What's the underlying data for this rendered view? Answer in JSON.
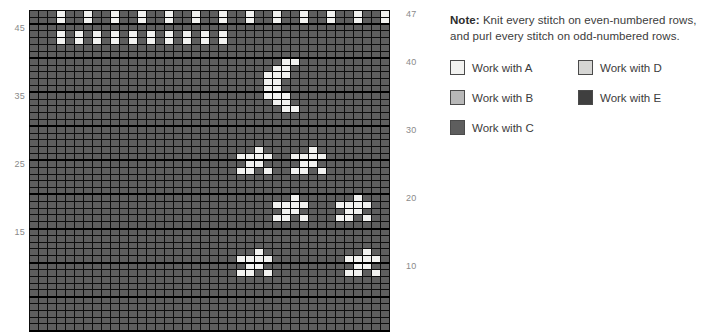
{
  "note": {
    "prefix": "Note:",
    "text": " Knit every stitch on even-numbered rows, and purl every stitch on odd-numbered rows."
  },
  "legend": {
    "items": [
      {
        "label": "Work with A",
        "color": "#f2f2f0",
        "key": "A"
      },
      {
        "label": "Work with B",
        "color": "#b8b8b8",
        "key": "B"
      },
      {
        "label": "Work with C",
        "color": "#5e5e5e",
        "key": "C"
      },
      {
        "label": "Work with D",
        "color": "#d6d6d4",
        "key": "D"
      },
      {
        "label": "Work with E",
        "color": "#3f3f3f",
        "key": "E"
      }
    ]
  },
  "axis": {
    "left_labels": [
      "45",
      "35",
      "25",
      "15"
    ],
    "right_labels": [
      "47",
      "40",
      "30",
      "20",
      "10"
    ]
  },
  "chart_data": {
    "type": "heatmap",
    "title": "",
    "xlabel": "",
    "ylabel": "",
    "subtitle": "",
    "grid": true,
    "legend_position": "right",
    "columns": 40,
    "rows": 47,
    "row_numbers_right": [
      47,
      40,
      30,
      20,
      10
    ],
    "row_numbers_left": [
      45,
      35,
      25,
      15
    ],
    "palette": {
      "A": "#f2f2f0",
      "B": "#b8b8b8",
      "C": "#5e5e5e",
      "D": "#d6d6d4",
      "E": "#3f3f3f"
    },
    "background_symbol": "C",
    "cells": [
      {
        "row": 47,
        "cols": [
          4,
          7,
          10,
          13,
          16,
          19,
          22,
          25,
          28,
          31,
          34,
          37,
          40
        ],
        "symbol": "A"
      },
      {
        "row": 46,
        "cols": [
          4,
          7,
          10,
          13,
          16,
          19,
          22,
          25,
          28,
          31,
          34,
          37,
          40
        ],
        "symbol": "A"
      },
      {
        "row": 44,
        "cols": [
          4,
          6,
          8,
          10,
          12,
          14,
          16,
          18,
          20,
          22
        ],
        "symbol": "A"
      },
      {
        "row": 43,
        "cols": [
          4,
          6,
          8,
          10,
          12,
          14,
          16,
          18,
          20,
          22
        ],
        "symbol": "A"
      },
      {
        "row": 40,
        "cols": [
          29,
          30
        ],
        "symbol": "A"
      },
      {
        "row": 39,
        "cols": [
          28,
          29
        ],
        "symbol": "A"
      },
      {
        "row": 38,
        "cols": [
          27,
          28,
          29
        ],
        "symbol": "A"
      },
      {
        "row": 37,
        "cols": [
          27,
          28
        ],
        "symbol": "A"
      },
      {
        "row": 36,
        "cols": [
          27,
          28
        ],
        "symbol": "A"
      },
      {
        "row": 35,
        "cols": [
          27,
          28,
          29
        ],
        "symbol": "A"
      },
      {
        "row": 34,
        "cols": [
          28,
          29
        ],
        "symbol": "A"
      },
      {
        "row": 33,
        "cols": [
          29,
          30
        ],
        "symbol": "A"
      },
      {
        "row": 27,
        "cols": [
          26
        ],
        "symbol": "A"
      },
      {
        "row": 27,
        "cols": [
          32
        ],
        "symbol": "A"
      },
      {
        "row": 26,
        "cols": [
          24,
          25,
          26,
          27
        ],
        "symbol": "A"
      },
      {
        "row": 26,
        "cols": [
          30,
          31,
          32,
          33
        ],
        "symbol": "A"
      },
      {
        "row": 25,
        "cols": [
          25,
          26
        ],
        "symbol": "A"
      },
      {
        "row": 25,
        "cols": [
          31,
          32
        ],
        "symbol": "A"
      },
      {
        "row": 24,
        "cols": [
          24,
          25,
          27
        ],
        "symbol": "A"
      },
      {
        "row": 24,
        "cols": [
          30,
          31,
          33
        ],
        "symbol": "A"
      },
      {
        "row": 20,
        "cols": [
          30
        ],
        "symbol": "A"
      },
      {
        "row": 20,
        "cols": [
          37
        ],
        "symbol": "A"
      },
      {
        "row": 19,
        "cols": [
          28,
          29,
          30,
          31
        ],
        "symbol": "A"
      },
      {
        "row": 19,
        "cols": [
          35,
          36,
          37,
          38
        ],
        "symbol": "A"
      },
      {
        "row": 18,
        "cols": [
          29,
          30
        ],
        "symbol": "A"
      },
      {
        "row": 18,
        "cols": [
          36,
          37
        ],
        "symbol": "A"
      },
      {
        "row": 17,
        "cols": [
          28,
          29,
          31
        ],
        "symbol": "A"
      },
      {
        "row": 17,
        "cols": [
          35,
          36,
          38
        ],
        "symbol": "A"
      },
      {
        "row": 12,
        "cols": [
          26
        ],
        "symbol": "A"
      },
      {
        "row": 12,
        "cols": [
          38
        ],
        "symbol": "A"
      },
      {
        "row": 11,
        "cols": [
          24,
          25,
          26,
          27
        ],
        "symbol": "A"
      },
      {
        "row": 11,
        "cols": [
          36,
          37,
          38,
          39
        ],
        "symbol": "A"
      },
      {
        "row": 10,
        "cols": [
          25,
          26
        ],
        "symbol": "A"
      },
      {
        "row": 10,
        "cols": [
          37,
          38
        ],
        "symbol": "A"
      },
      {
        "row": 9,
        "cols": [
          24,
          25,
          27
        ],
        "symbol": "A"
      },
      {
        "row": 9,
        "cols": [
          36,
          37,
          39
        ],
        "symbol": "A"
      }
    ]
  }
}
